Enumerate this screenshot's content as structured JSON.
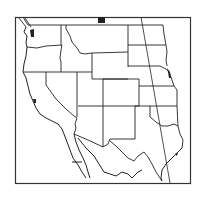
{
  "map": {
    "title": "Western United States",
    "region": "Western United States and northern Mexico",
    "type": "outline map",
    "frame": {
      "x": 15,
      "y": 17,
      "width": 176,
      "height": 167
    },
    "colors": {
      "line": "#222222",
      "background": "#ffffff",
      "water_fill": "#222222"
    },
    "states": [
      {
        "name": "Washington"
      },
      {
        "name": "Oregon"
      },
      {
        "name": "California"
      },
      {
        "name": "Idaho"
      },
      {
        "name": "Nevada"
      },
      {
        "name": "Montana"
      },
      {
        "name": "Wyoming"
      },
      {
        "name": "Utah"
      },
      {
        "name": "Arizona"
      },
      {
        "name": "Colorado"
      },
      {
        "name": "New Mexico"
      },
      {
        "name": "North Dakota"
      },
      {
        "name": "South Dakota"
      },
      {
        "name": "Nebraska"
      },
      {
        "name": "Kansas"
      },
      {
        "name": "Oklahoma"
      },
      {
        "name": "Texas"
      }
    ],
    "features": [
      {
        "name": "meridian-line"
      },
      {
        "name": "mexico-border"
      },
      {
        "name": "baja-california"
      }
    ]
  }
}
